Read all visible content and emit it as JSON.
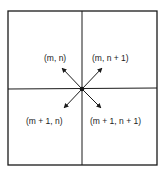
{
  "diagram": {
    "type": "grid-cell-neighbors",
    "labels": {
      "top_left": "(m, n)",
      "top_right": "(m, n + 1)",
      "bottom_left": "(m + 1, n)",
      "bottom_right": "(m + 1, n + 1)"
    },
    "colors": {
      "stroke": "#1a1a1a",
      "background": "#ffffff"
    }
  }
}
